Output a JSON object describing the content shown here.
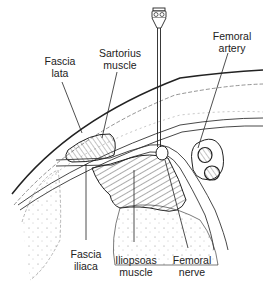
{
  "diagram": {
    "labels": {
      "fascia_lata": {
        "line1": "Fascia",
        "line2": "lata"
      },
      "sartorius_muscle": {
        "line1": "Sartorius",
        "line2": "muscle"
      },
      "femoral_artery": {
        "line1": "Femoral",
        "line2": "artery"
      },
      "fascia_iliaca": {
        "line1": "Fascia",
        "line2": "iliaca"
      },
      "iliopsoas_muscle": {
        "line1": "Iliopsoas",
        "line2": "muscle"
      },
      "femoral_nerve": {
        "line1": "Femoral",
        "line2": "nerve"
      }
    },
    "colors": {
      "line": "#222222",
      "background": "#ffffff",
      "hatch": "#444444",
      "vessel_fill": "#555555"
    },
    "elements": [
      "needle",
      "skin",
      "subcutaneous-tissue",
      "fascia-lata",
      "fascia-iliaca",
      "sartorius-muscle",
      "iliopsoas-muscle",
      "femoral-nerve",
      "femoral-artery",
      "femoral-vein"
    ]
  }
}
